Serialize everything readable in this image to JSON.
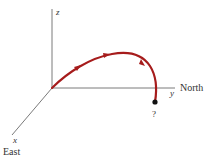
{
  "diagram": {
    "type": "3d-coordinate-trajectory",
    "axes": {
      "z": {
        "label": "z",
        "direction": ""
      },
      "y": {
        "label": "y",
        "direction": "North"
      },
      "x": {
        "label": "x",
        "direction": "East"
      }
    },
    "trajectory": {
      "color": "#a61c1c",
      "arrow_count": 3,
      "end_marker_label": "?"
    },
    "colors": {
      "axis": "#7a7a7a",
      "curve": "#a61c1c",
      "end_dot": "#111111",
      "text": "#333333"
    }
  }
}
